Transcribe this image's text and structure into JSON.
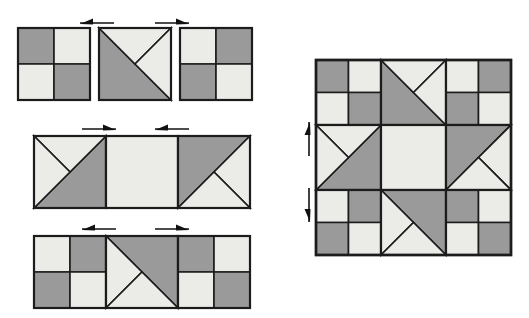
{
  "document": {
    "title": "Quilt Block Assembly Diagram",
    "description": "Piecing diagram showing three rows of quilt units with directional pressing arrows, and the finished assembled block at right.",
    "background_color": "#ffffff"
  },
  "palette": {
    "dark_fabric": "#9a9a9a",
    "light_fabric": "#ebebe8",
    "medium_fabric": "#c9c9c7",
    "outline": "#1c1c1c",
    "arrow": "#111111"
  },
  "legend": {
    "dark_label": "dark fabric",
    "light_label": "light fabric",
    "medium_label": "medium fabric"
  },
  "rows": [
    {
      "name": "row-1",
      "label": "Row 1",
      "x": 18,
      "y": 28,
      "cell": 72,
      "gap": 9,
      "units": [
        {
          "name": "four-patch-a",
          "type": "four-patch",
          "quadrants": [
            "dark",
            "light",
            "light",
            "dark"
          ]
        },
        {
          "name": "flying-geese-a",
          "type": "split-hst-upper-right",
          "main": "dark",
          "accent_left": "light",
          "accent_right": "light"
        },
        {
          "name": "four-patch-b",
          "type": "four-patch",
          "quadrants": [
            "light",
            "dark",
            "dark",
            "light"
          ]
        }
      ],
      "arrows": [
        {
          "name": "arrow-row1-left",
          "direction": "left",
          "x": 80,
          "y": 20,
          "length": 34
        },
        {
          "name": "arrow-row1-right",
          "direction": "right",
          "x": 155,
          "y": 20,
          "length": 34
        }
      ]
    },
    {
      "name": "row-2",
      "label": "Row 2",
      "x": 34,
      "y": 136,
      "cell": 72,
      "gap": 0,
      "units": [
        {
          "name": "flying-geese-b",
          "type": "split-hst-upper-left",
          "main": "light",
          "accent_left": "light",
          "accent_right": "dark"
        },
        {
          "name": "plain-square-center",
          "type": "plain",
          "fill": "light"
        },
        {
          "name": "flying-geese-c",
          "type": "split-hst-lower-right",
          "main": "dark",
          "accent_left": "light",
          "accent_right": "light"
        }
      ],
      "arrows": [
        {
          "name": "arrow-row2-left",
          "direction": "right",
          "x": 82,
          "y": 126,
          "length": 34
        },
        {
          "name": "arrow-row2-right",
          "direction": "left",
          "x": 155,
          "y": 126,
          "length": 34
        }
      ]
    },
    {
      "name": "row-3",
      "label": "Row 3",
      "x": 34,
      "y": 236,
      "cell": 72,
      "gap": 0,
      "units": [
        {
          "name": "four-patch-c",
          "type": "four-patch",
          "quadrants": [
            "light",
            "dark",
            "dark",
            "light"
          ]
        },
        {
          "name": "flying-geese-d",
          "type": "split-hst-lower-left",
          "main": "dark",
          "accent_left": "light",
          "accent_right": "light"
        },
        {
          "name": "four-patch-d",
          "type": "four-patch",
          "quadrants": [
            "dark",
            "light",
            "light",
            "dark"
          ]
        }
      ],
      "arrows": [
        {
          "name": "arrow-row3-left",
          "direction": "left",
          "x": 82,
          "y": 226,
          "length": 34
        },
        {
          "name": "arrow-row3-right",
          "direction": "right",
          "x": 155,
          "y": 226,
          "length": 34
        }
      ]
    }
  ],
  "assembled_block": {
    "name": "assembled-block",
    "label": "Finished block",
    "x": 316,
    "y": 60,
    "cell": 65,
    "grid": [
      [
        {
          "name": "corner-top-left",
          "type": "four-patch",
          "quadrants": [
            "dark",
            "light",
            "light",
            "dark"
          ]
        },
        {
          "name": "top-center",
          "type": "split-hst-upper-right",
          "main": "dark",
          "accent_left": "light",
          "accent_right": "light"
        },
        {
          "name": "corner-top-right",
          "type": "four-patch",
          "quadrants": [
            "light",
            "dark",
            "dark",
            "light"
          ]
        }
      ],
      [
        {
          "name": "middle-left",
          "type": "split-hst-upper-left",
          "main": "light",
          "accent_left": "light",
          "accent_right": "dark"
        },
        {
          "name": "middle-center",
          "type": "plain",
          "fill": "light"
        },
        {
          "name": "middle-right",
          "type": "split-hst-lower-right",
          "main": "dark",
          "accent_left": "light",
          "accent_right": "light"
        }
      ],
      [
        {
          "name": "corner-bottom-left",
          "type": "four-patch",
          "quadrants": [
            "light",
            "dark",
            "dark",
            "light"
          ]
        },
        {
          "name": "bottom-center",
          "type": "split-hst-lower-left",
          "main": "dark",
          "accent_left": "light",
          "accent_right": "light"
        },
        {
          "name": "corner-bottom-right",
          "type": "four-patch",
          "quadrants": [
            "dark",
            "light",
            "light",
            "dark"
          ]
        }
      ]
    ],
    "arrows": [
      {
        "name": "arrow-block-up",
        "direction": "up",
        "x": 306,
        "y": 122,
        "length": 34
      },
      {
        "name": "arrow-block-down",
        "direction": "down",
        "x": 306,
        "y": 188,
        "length": 34
      }
    ]
  }
}
